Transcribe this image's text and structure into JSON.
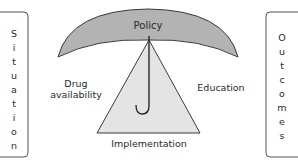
{
  "diagram": {
    "left_box": {
      "label": "Situation",
      "letters": [
        "S",
        "i",
        "t",
        "u",
        "a",
        "t",
        "i",
        "o",
        "n"
      ]
    },
    "right_box": {
      "label": "Outcomes",
      "letters": [
        "O",
        "u",
        "t",
        "c",
        "o",
        "m",
        "e",
        "s"
      ]
    },
    "canopy": {
      "label": "Policy",
      "fill": "#b3b3b3",
      "stroke": "#3a3a3a"
    },
    "triangle": {
      "label": "Implementation",
      "fill": "#e4e4e4",
      "stroke": "#3a3a3a"
    },
    "left_factor": {
      "line1": "Drug",
      "line2": "availability"
    },
    "right_factor": {
      "label": "Education"
    },
    "handle": {
      "stroke": "#2a2a2a"
    }
  }
}
